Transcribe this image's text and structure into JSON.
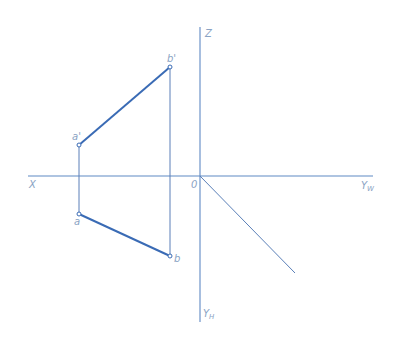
{
  "diagram": {
    "type": "orthographic-projection",
    "colors": {
      "axis": "#5f89c4",
      "line_projection": "#3a6bb5",
      "thin_line": "#5a7fb8",
      "label": "#8aa3c4",
      "point_fill": "#ffffff"
    },
    "axes": {
      "z_label": "Z",
      "x_label": "X",
      "origin_label": "0",
      "yw_label": "Y",
      "yw_sub": "W",
      "yh_label": "Y",
      "yh_sub": "H"
    },
    "points": {
      "b_prime": {
        "label": "b'",
        "x": 170,
        "y": 67
      },
      "a_prime": {
        "label": "a'",
        "x": 79,
        "y": 145
      },
      "a": {
        "label": "a",
        "x": 79,
        "y": 214
      },
      "b": {
        "label": "b",
        "x": 170,
        "y": 256
      }
    },
    "segments": [
      {
        "name": "a'b'",
        "from": "a_prime",
        "to": "b_prime",
        "weight": "thick"
      },
      {
        "name": "ab",
        "from": "a",
        "to": "b",
        "weight": "thick"
      },
      {
        "name": "a'-a projector",
        "from": "a_prime",
        "to": "a",
        "weight": "thin"
      },
      {
        "name": "b'-b projector",
        "from": "b_prime",
        "to": "b",
        "weight": "thin"
      },
      {
        "name": "45-degree line",
        "from": "origin",
        "to": "end",
        "weight": "thin"
      }
    ]
  }
}
